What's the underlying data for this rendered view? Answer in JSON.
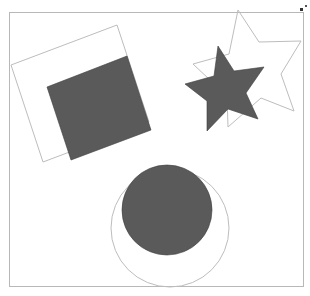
{
  "canvas": {
    "background": "#ffffff",
    "frame_stroke": "#b8b8b8",
    "outline_stroke": "#bdbdbd",
    "fill_color": "#5a5a5a",
    "fill_stroke": "#3c3c3c"
  },
  "shapes": [
    {
      "name": "outlined-square",
      "kind": "square",
      "style": "outline"
    },
    {
      "name": "filled-square",
      "kind": "square",
      "style": "filled"
    },
    {
      "name": "outlined-star",
      "kind": "star",
      "style": "outline"
    },
    {
      "name": "filled-star",
      "kind": "star",
      "style": "filled"
    },
    {
      "name": "outlined-circle",
      "kind": "circle",
      "style": "outline"
    },
    {
      "name": "filled-circle",
      "kind": "circle",
      "style": "filled"
    }
  ],
  "resize_handle": {
    "icon": "resize-handle-icon"
  }
}
